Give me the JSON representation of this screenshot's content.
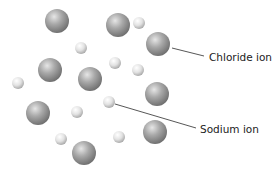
{
  "diagram": {
    "labels": {
      "chloride": "Chloride ion",
      "sodium": "Sodium ion"
    },
    "colors": {
      "background": "#ffffff",
      "chloride_ion": "#8a8a8a",
      "sodium_ion": "#d8d8d8",
      "leader_line": "#444444",
      "text": "#222222"
    },
    "chloride_ions": [
      {
        "x": 57,
        "y": 21,
        "r": 12
      },
      {
        "x": 118,
        "y": 25,
        "r": 12
      },
      {
        "x": 158,
        "y": 44,
        "r": 12
      },
      {
        "x": 50,
        "y": 70,
        "r": 12
      },
      {
        "x": 90,
        "y": 79,
        "r": 12
      },
      {
        "x": 157,
        "y": 94,
        "r": 12
      },
      {
        "x": 38,
        "y": 113,
        "r": 12
      },
      {
        "x": 155,
        "y": 132,
        "r": 12
      },
      {
        "x": 84,
        "y": 153,
        "r": 12
      }
    ],
    "sodium_ions": [
      {
        "x": 139,
        "y": 23,
        "r": 6
      },
      {
        "x": 81,
        "y": 48,
        "r": 6
      },
      {
        "x": 115,
        "y": 63,
        "r": 6
      },
      {
        "x": 138,
        "y": 70,
        "r": 6
      },
      {
        "x": 18,
        "y": 83,
        "r": 6
      },
      {
        "x": 109,
        "y": 102,
        "r": 6
      },
      {
        "x": 77,
        "y": 112,
        "r": 6
      },
      {
        "x": 61,
        "y": 139,
        "r": 6
      },
      {
        "x": 119,
        "y": 137,
        "r": 6
      }
    ],
    "leaders": {
      "chloride": {
        "x1": 172,
        "y1": 48,
        "x2": 204,
        "y2": 56
      },
      "sodium": {
        "x1": 115,
        "y1": 104,
        "x2": 196,
        "y2": 128
      }
    }
  }
}
